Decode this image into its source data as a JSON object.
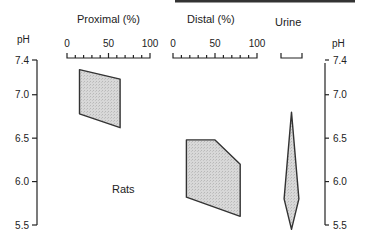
{
  "chart_data": {
    "type": "area",
    "title": "",
    "annotation": "Rats",
    "yaxis": {
      "label": "pH",
      "range": [
        5.5,
        7.4
      ],
      "ticks": [
        7.4,
        7.0,
        6.5,
        6.0,
        5.5
      ],
      "tick_labels": [
        "7.4",
        "7.0",
        "6.5",
        "6.0",
        "5.5"
      ],
      "sides": [
        "left",
        "right"
      ]
    },
    "panels": [
      {
        "name": "Proximal (%)",
        "xrange": [
          0,
          100
        ],
        "tick_labels": [
          "0",
          "50",
          "100"
        ],
        "minor_ticks": 10,
        "region": [
          [
            15,
            7.29
          ],
          [
            64,
            7.18
          ],
          [
            64,
            6.62
          ],
          [
            15,
            6.78
          ]
        ]
      },
      {
        "name": "Distal (%)",
        "xrange": [
          0,
          100
        ],
        "tick_labels": [
          "0",
          "50",
          "100"
        ],
        "minor_ticks": 10,
        "region": [
          [
            16,
            6.48
          ],
          [
            50,
            6.48
          ],
          [
            80,
            6.2
          ],
          [
            80,
            5.6
          ],
          [
            16,
            5.82
          ]
        ]
      },
      {
        "name": "Urine",
        "xrange": [
          0,
          100
        ],
        "tick_labels": [],
        "minor_ticks": 0,
        "region": [
          [
            50,
            6.8
          ],
          [
            85,
            5.8
          ],
          [
            50,
            5.45
          ],
          [
            15,
            5.8
          ]
        ]
      }
    ],
    "fill_color": "#d4d4d4",
    "stroke_color": "#333333"
  }
}
